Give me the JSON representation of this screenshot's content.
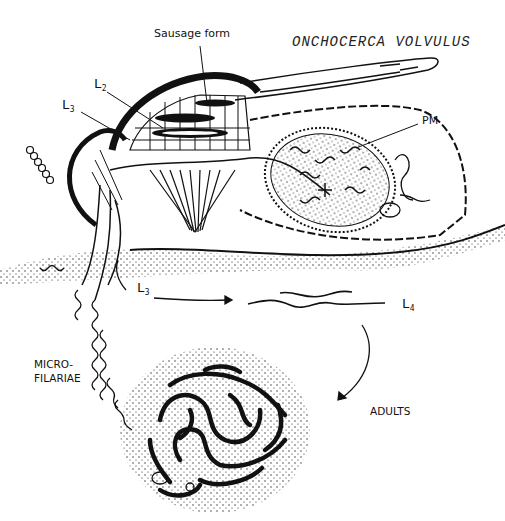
{
  "title": "ONCHOCERCA VOLVULUS",
  "labels": {
    "sausage_form": "Sausage form",
    "l2": {
      "letter": "L",
      "sub": "2"
    },
    "l3_fly": {
      "letter": "L",
      "sub": "3"
    },
    "pm": "PM",
    "l3_skin": {
      "letter": "L",
      "sub": "3"
    },
    "l4": {
      "letter": "L",
      "sub": "4"
    },
    "microfilariae_line1": "MICRO-",
    "microfilariae_line2": "FILARIAE",
    "adults": "ADULTS"
  },
  "colors": {
    "ink": "#111111",
    "background": "#ffffff"
  }
}
